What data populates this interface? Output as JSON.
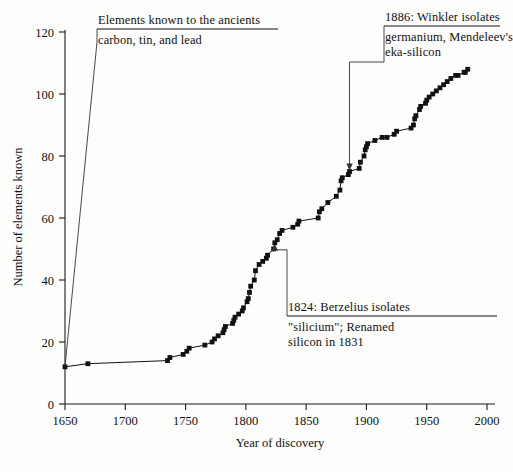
{
  "chart_data": {
    "type": "line",
    "title": "",
    "xlabel": "Year of discovery",
    "ylabel": "Number of elements known",
    "xlim": [
      1650,
      2000
    ],
    "ylim": [
      0,
      120
    ],
    "xticks": [
      1650,
      1700,
      1750,
      1800,
      1850,
      1900,
      1950,
      2000
    ],
    "yticks": [
      0,
      20,
      40,
      60,
      80,
      100,
      120
    ],
    "grid": false,
    "legend": null,
    "marker": "filled-square",
    "series": [
      {
        "name": "Cumulative elements known",
        "x": [
          1650,
          1669,
          1735,
          1737,
          1748,
          1751,
          1753,
          1766,
          1772,
          1774,
          1777,
          1781,
          1782,
          1783,
          1789,
          1790,
          1791,
          1794,
          1797,
          1798,
          1801,
          1802,
          1803,
          1804,
          1807,
          1808,
          1811,
          1814,
          1817,
          1818,
          1823,
          1824,
          1826,
          1828,
          1830,
          1839,
          1843,
          1844,
          1860,
          1861,
          1863,
          1868,
          1875,
          1878,
          1879,
          1880,
          1885,
          1886,
          1894,
          1895,
          1898,
          1899,
          1900,
          1901,
          1907,
          1913,
          1917,
          1923,
          1925,
          1937,
          1939,
          1940,
          1941,
          1944,
          1945,
          1949,
          1950,
          1952,
          1955,
          1958,
          1961,
          1964,
          1967,
          1970,
          1974,
          1976,
          1981,
          1982,
          1984
        ],
        "values": [
          12,
          13,
          14,
          15,
          16,
          17,
          18,
          19,
          20,
          21,
          22,
          23,
          24,
          25,
          26,
          27,
          28,
          29,
          30,
          31,
          33,
          34,
          36,
          38,
          40,
          43,
          45,
          46,
          47,
          48,
          50,
          52,
          53,
          55,
          56,
          57,
          58,
          59,
          60,
          62,
          63,
          65,
          67,
          69,
          72,
          73,
          74,
          75,
          76,
          78,
          80,
          82,
          83,
          84,
          85,
          86,
          86,
          87,
          88,
          89,
          90,
          92,
          93,
          95,
          96,
          97,
          98,
          99,
          100,
          101,
          102,
          103,
          104,
          105,
          106,
          106,
          107,
          107,
          108
        ]
      }
    ],
    "annotations": [
      {
        "id": "ancients",
        "head": "Elements known to the ancients",
        "body": "carbon, tin, and lead",
        "points_to": {
          "x": 1650,
          "y": 12
        }
      },
      {
        "id": "winkler",
        "head": "1886: Winkler isolates",
        "body": "germanium, Mendeleev's\neka-silicon",
        "body_line1": "germanium, Mendeleev's",
        "body_line2": "eka-silicon",
        "points_to": {
          "x": 1886,
          "y": 75
        }
      },
      {
        "id": "berzelius",
        "head": "1824: Berzelius isolates",
        "body": "\"silicium\"; Renamed\nsilicon in 1831",
        "body_line1": "\"silicium\"; Renamed",
        "body_line2": "silicon in 1831",
        "points_to": {
          "x": 1824,
          "y": 52
        }
      }
    ],
    "colors": {
      "line": "#111111",
      "marker": "#111111",
      "axis": "#1a1a1a",
      "background": "#fdfdfb"
    }
  }
}
